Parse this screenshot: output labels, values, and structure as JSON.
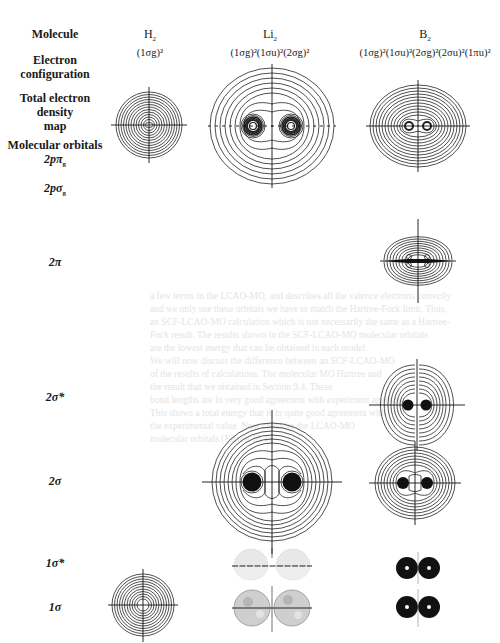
{
  "figure": {
    "row_labels": {
      "molecule": "Molecule",
      "electron_configuration": "Electron configuration",
      "electron_configuration_line1": "Electron",
      "electron_configuration_line2": "configuration",
      "total_density_line1": "Total electron",
      "total_density_line2": "density",
      "total_density_line3": "map",
      "molecular_orbitals": "Molecular orbitals",
      "orbital_2ppi_g": "2pπ",
      "orbital_2ppi_g_sub": "g",
      "orbital_2psigma_g": "2pσ",
      "orbital_2psigma_g_sub": "g",
      "orbital_2pi": "2π",
      "orbital_2sigma_star": "2σ*",
      "orbital_2sigma": "2σ",
      "orbital_1sigma_star": "1σ*",
      "orbital_1sigma": "1σ"
    },
    "columns": [
      {
        "molecule": "H",
        "molecule_sub": "2",
        "configuration": "(1σg)²"
      },
      {
        "molecule": "Li",
        "molecule_sub": "2",
        "configuration": "(1σg)²(1σu)²(2σg)²"
      },
      {
        "molecule": "B",
        "molecule_sub": "2",
        "configuration": "(1σg)²(1σu)²(2σg)²(2σu)²(1πu)²"
      }
    ],
    "maps_present": {
      "H2": [
        "total_density",
        "1σ"
      ],
      "Li2": [
        "total_density",
        "2σ",
        "1σ*",
        "1σ"
      ],
      "B2": [
        "total_density",
        "2π",
        "2σ*",
        "2σ",
        "1σ*",
        "1σ"
      ]
    }
  },
  "show_through_text": [
    "a few terms in the LCAO-MO, and describes all the valence electrons correctly",
    "and we only use these orbitals we have to match the Hartree-Fock limit. Thus,",
    "an SCF-LCAO-MO calculation which is not necessarily the same as a Hartree-",
    "Fock result. The results shown in the SCF-LCAO-MO molecular orbitals",
    "are the lowest energy that can be obtained in each model.",
    "We will now discuss the difference between an SCF-LCAO-MO",
    "of the results of calculations. The molecular MO Hartree and",
    "the result that we obtained in Section 9.4. These",
    "bond lengths are in very good agreement with experiment again is",
    "This shows a total energy that is in quite good agreement with",
    "the experimental value. Now consider the LCAO-MO",
    "molecular orbitals (Figure 10.4)."
  ]
}
